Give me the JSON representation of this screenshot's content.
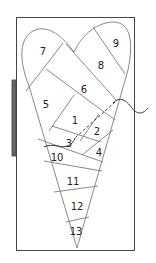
{
  "diagram": {
    "type": "foundation paper piecing pattern",
    "shape": "heart",
    "colors": {
      "line": "#7a7a7a",
      "frame": "#444444",
      "binder": "#666666",
      "thread": "#222222",
      "text": "#222222"
    },
    "pieces": [
      {
        "id": "1",
        "label": "1",
        "x": 75,
        "y": 120
      },
      {
        "id": "2",
        "label": "2",
        "x": 97,
        "y": 131
      },
      {
        "id": "3",
        "label": "3",
        "x": 69,
        "y": 143
      },
      {
        "id": "4",
        "label": "4",
        "x": 99,
        "y": 152
      },
      {
        "id": "5",
        "label": "5",
        "x": 46,
        "y": 104
      },
      {
        "id": "6",
        "label": "6",
        "x": 84,
        "y": 89
      },
      {
        "id": "7",
        "label": "7",
        "x": 43,
        "y": 51
      },
      {
        "id": "8",
        "label": "8",
        "x": 101,
        "y": 65
      },
      {
        "id": "9",
        "label": "9",
        "x": 116,
        "y": 43
      },
      {
        "id": "10",
        "label": "10",
        "x": 57,
        "y": 157
      },
      {
        "id": "11",
        "label": "11",
        "x": 73,
        "y": 181
      },
      {
        "id": "12",
        "label": "12",
        "x": 77,
        "y": 206
      },
      {
        "id": "13",
        "label": "13",
        "x": 76,
        "y": 231
      }
    ]
  }
}
